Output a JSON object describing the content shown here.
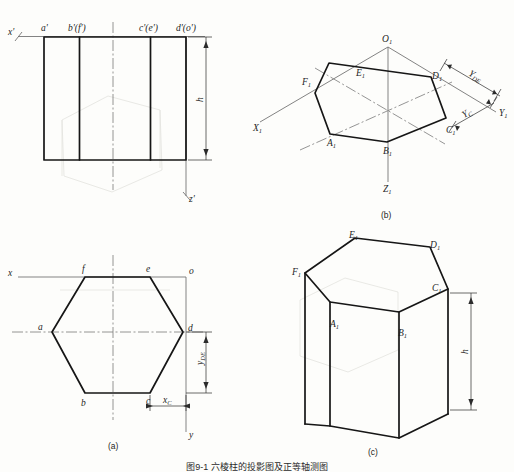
{
  "document": {
    "type": "engineering-drawing",
    "subject": "hexagonal prism orthographic and axonometric projections",
    "figure_caption": "图9-1  六棱柱的投影图及正等轴测图"
  },
  "panels": {
    "front_view": {
      "label": "",
      "axis_x": "x'",
      "axis_z": "z'",
      "height_dim": "h",
      "vertex_labels": [
        "a'",
        "b'(f')",
        "c'(e')",
        "d'(o')"
      ]
    },
    "panel_b": {
      "label": "(b)",
      "axis_x1": "X1",
      "axis_y1": "Y1",
      "axis_z1": "Z1",
      "origin": "O1",
      "vertices": [
        "A1",
        "B1",
        "C1",
        "D1",
        "E1",
        "F1"
      ],
      "dim_y_de": "YDE",
      "dim_y_c": "YC"
    },
    "panel_a": {
      "label": "(a)",
      "axis_x": "x",
      "axis_y": "y",
      "origin": "o",
      "vertices": [
        "a",
        "b",
        "c",
        "d",
        "e",
        "f"
      ],
      "dim_y_de": "yDE",
      "dim_x_c": "xC"
    },
    "panel_c": {
      "label": "(c)",
      "vertices": [
        "A1",
        "B1",
        "C1",
        "D1",
        "E1",
        "F1"
      ],
      "height_dim": "h"
    }
  },
  "colors": {
    "ink": "#161616",
    "axis": "#6d6d6d",
    "dim": "#3a3a3a",
    "paper": "#fdfdfb",
    "ghost": "#cfcfc9"
  }
}
